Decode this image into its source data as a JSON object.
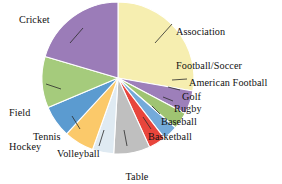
{
  "chart_data": {
    "type": "pie",
    "title": "",
    "subtitle": "",
    "xlabel": "",
    "ylabel": "",
    "legend_position": "none",
    "grid": false,
    "labels_mode": "leader-line callouts around pie",
    "categories": [
      "Association Football/Soccer",
      "American Football",
      "Golf",
      "Rugby",
      "Baseball",
      "Basketball",
      "Table Tennis",
      "Volleyball",
      "Tennis",
      "Field Hockey",
      "Cricket"
    ],
    "values": [
      30.5,
      5.5,
      4.0,
      3.5,
      4.0,
      8.5,
      5.0,
      7.0,
      7.5,
      12.0,
      22.5
    ],
    "units": "percent of total",
    "start_angle_deg": -90,
    "direction": "clockwise",
    "colors": [
      "#f6eeb0",
      "#9d7fba",
      "#9fc472",
      "#74aada",
      "#e8453c",
      "#bfbfbf",
      "#dfeaf2",
      "#fbc96a",
      "#5b9bd0",
      "#a5cb7c",
      "#9b7cb8"
    ],
    "slices": [
      {
        "label": "Association Football/Soccer",
        "value": 30.5,
        "color": "#f6eeb0"
      },
      {
        "label": "American Football",
        "value": 5.5,
        "color": "#9d7fba"
      },
      {
        "label": "Golf",
        "value": 4.0,
        "color": "#9fc472"
      },
      {
        "label": "Rugby",
        "value": 3.5,
        "color": "#74aada"
      },
      {
        "label": "Baseball",
        "value": 4.0,
        "color": "#e8453c"
      },
      {
        "label": "Basketball",
        "value": 8.5,
        "color": "#bfbfbf"
      },
      {
        "label": "Table Tennis",
        "value": 5.0,
        "color": "#dfeaf2"
      },
      {
        "label": "Volleyball",
        "value": 7.0,
        "color": "#fbc96a"
      },
      {
        "label": "Tennis",
        "value": 7.5,
        "color": "#5b9bd0"
      },
      {
        "label": "Field Hockey",
        "value": 12.0,
        "color": "#a5cb7c"
      },
      {
        "label": "Cricket",
        "value": 22.5,
        "color": "#9b7cb8"
      }
    ]
  },
  "labels": {
    "soccer_line1": "Association",
    "soccer_line2": "Football/Soccer",
    "cricket": "Cricket",
    "field_hockey_line1": "Field",
    "field_hockey_line2": "Hockey",
    "tennis": "Tennis",
    "volleyball": "Volleyball",
    "table_tennis_line1": "Table",
    "table_tennis_line2": "Tennis",
    "basketball": "Basketball",
    "baseball": "Baseball",
    "rugby": "Rugby",
    "golf": "Golf",
    "american_football": "American Football"
  }
}
